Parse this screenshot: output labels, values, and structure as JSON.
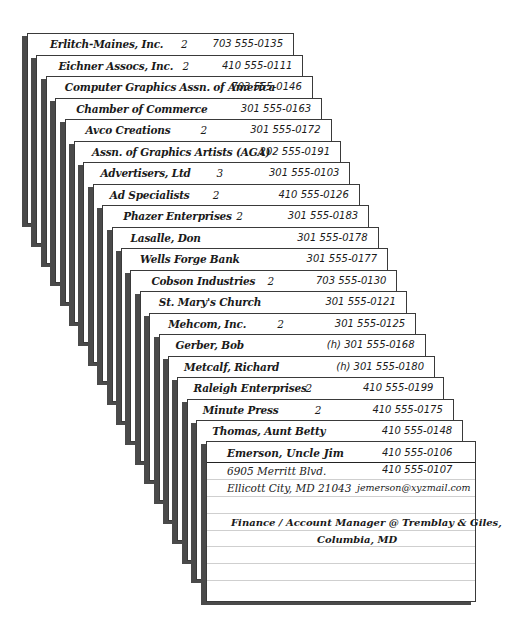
{
  "app": {
    "title": "Cardfile - Address Cards"
  },
  "layout": {
    "first_card": {
      "left": 27,
      "top": 33,
      "width": 267
    },
    "step": {
      "dx": 9.4,
      "dy": 21.5
    },
    "foot_step": 19.8,
    "first_foot": 224
  },
  "colors": {
    "card_border": "#3a3a3a",
    "card_shadow": "#4a4a4a",
    "rule_line": "#cfcfcf",
    "header_rule": "#222222",
    "text": "#1a1a1a"
  },
  "cards": [
    {
      "name": "Erlitch-Maines, Inc.",
      "count": "2",
      "phone": "703 555-0135",
      "name_x": 22,
      "count_x": 153
    },
    {
      "name": "Eichner Assocs, Inc.",
      "count": "2",
      "phone": "410 555-0111",
      "name_x": 21,
      "count_x": 145
    },
    {
      "name": "Computer Graphics Assn. of America",
      "count": "",
      "phone": "703 555-0146",
      "name_x": 18,
      "count_x": 0
    },
    {
      "name": "Chamber of Commerce",
      "count": "",
      "phone": "301 555-0163",
      "name_x": 20,
      "count_x": 0
    },
    {
      "name": "Avco Creations",
      "count": "2",
      "phone": "301 555-0172",
      "name_x": 20,
      "count_x": 135
    },
    {
      "name": "Assn. of Graphics Artists (AGA)",
      "count": "",
      "phone": "202 555-0191",
      "name_x": 17,
      "count_x": 0
    },
    {
      "name": "Advertisers, Ltd",
      "count": "3",
      "phone": "301 555-0103",
      "name_x": 16,
      "count_x": 132
    },
    {
      "name": "Ad Specialists",
      "count": "2",
      "phone": "410 555-0126",
      "name_x": 16,
      "count_x": 119
    },
    {
      "name": "Phazer Enterprises",
      "count": "2",
      "phone": "301 555-0183",
      "name_x": 20,
      "count_x": 133
    },
    {
      "name": "Lasalle, Don",
      "count": "",
      "phone": "301 555-0178",
      "name_x": 18,
      "count_x": 0
    },
    {
      "name": "Wells Forge Bank",
      "count": "",
      "phone": "301 555-0177",
      "name_x": 18,
      "count_x": 0
    },
    {
      "name": "Cobson Industries",
      "count": "2",
      "phone": "703 555-0130",
      "name_x": 20,
      "count_x": 136
    },
    {
      "name": "St. Mary's Church",
      "count": "",
      "phone": "301 555-0121",
      "name_x": 18,
      "count_x": 0
    },
    {
      "name": "Mehcom, Inc.",
      "count": "2",
      "phone": "301 555-0125",
      "name_x": 18,
      "count_x": 127
    },
    {
      "name": "Gerber, Bob",
      "count": "",
      "phone": "(h) 301 555-0168",
      "name_x": 16,
      "count_x": 0
    },
    {
      "name": "Metcalf, Richard",
      "count": "",
      "phone": "(h) 301 555-0180",
      "name_x": 15,
      "count_x": 0
    },
    {
      "name": "Raleigh Enterprises",
      "count": "2",
      "phone": "410 555-0199",
      "name_x": 15,
      "count_x": 127
    },
    {
      "name": "Minute Press",
      "count": "2",
      "phone": "410 555-0175",
      "name_x": 15,
      "count_x": 127
    },
    {
      "name": "Thomas, Aunt Betty",
      "count": "",
      "phone": "410 555-0148",
      "name_x": 15,
      "count_x": 0
    }
  ],
  "front_card": {
    "name": "Emerson, Uncle Jim",
    "phone1": "410 555-0106",
    "address1": "6905 Merritt Blvd.",
    "phone2": "410 555-0107",
    "address2": "Ellicott City, MD 21043",
    "email": "jemerson@xyzmail.com",
    "note_line1": "Finance / Account Manager @ Tremblay & Giles,",
    "note_line2": "Columbia, MD"
  }
}
